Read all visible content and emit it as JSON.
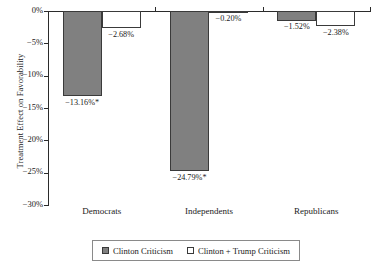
{
  "chart_data": {
    "type": "bar",
    "title": "",
    "xlabel": "",
    "ylabel": "Treatment Effect on Favorability",
    "categories": [
      "Democrats",
      "Independents",
      "Republicans"
    ],
    "ylim": [
      -30,
      0
    ],
    "ytick_labels": [
      "0%",
      "−5%",
      "−10%",
      "−15%",
      "−20%",
      "−25%",
      "−30%"
    ],
    "ytick_values": [
      0,
      -5,
      -10,
      -15,
      -20,
      -25,
      -30
    ],
    "grid": false,
    "legend_position": "bottom",
    "series": [
      {
        "name": "Clinton Criticism",
        "color": "#808080",
        "values": [
          -13.16,
          -24.79,
          -1.52
        ],
        "labels": [
          "−13.16%*",
          "−24.79%*",
          "−1.52%"
        ]
      },
      {
        "name": "Clinton + Trump Criticism",
        "color": "#ffffff",
        "values": [
          -2.68,
          -0.2,
          -2.38
        ],
        "labels": [
          "−2.68%",
          "−0.20%",
          "−2.38%"
        ]
      }
    ],
    "annotations": [
      "* denotes statistical significance"
    ]
  },
  "legend": {
    "items": [
      {
        "label": "Clinton Criticism"
      },
      {
        "label": "Clinton + Trump Criticism"
      }
    ]
  }
}
